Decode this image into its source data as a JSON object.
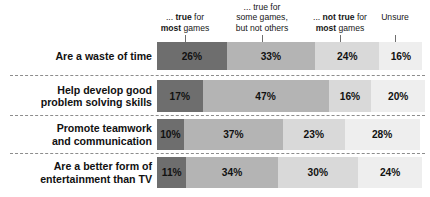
{
  "chart_data": {
    "type": "bar",
    "subtype": "stacked-horizontal-100",
    "title": "",
    "xlabel": "",
    "ylabel": "",
    "xlim": [
      0,
      100
    ],
    "grid": false,
    "legend_position": "top",
    "value_suffix": "%",
    "categories": [
      "Are a waste of time",
      "Help develop good problem solving skills",
      "Promote teamwork and communication",
      "Are a better form of entertainment than TV"
    ],
    "series": [
      {
        "name": "... true for most games",
        "values": [
          26,
          17,
          10,
          11
        ],
        "color": "#6e6e6e"
      },
      {
        "name": "... true for some games, but not others",
        "values": [
          33,
          47,
          37,
          34
        ],
        "color": "#b4b4b4"
      },
      {
        "name": "... not true for most games",
        "values": [
          24,
          16,
          23,
          30
        ],
        "color": "#d9d9d9"
      },
      {
        "name": "Unsure",
        "values": [
          16,
          20,
          28,
          24
        ],
        "color": "#eeeeee"
      }
    ]
  },
  "legend": {
    "columns": [
      {
        "id": "col-true-most",
        "line1_pre": "... ",
        "line1_bold": "true",
        "line1_post": " for",
        "line2_bold": "most",
        "line2_post": " games",
        "line0": ""
      },
      {
        "id": "col-some-games",
        "line0": "... true for",
        "line1_pre": "",
        "line1_bold": "",
        "line1_post": "some games,",
        "line2_bold": "",
        "line2_post": "but not others"
      },
      {
        "id": "col-not-true",
        "line0": "",
        "line1_pre": "... ",
        "line1_bold": "not true",
        "line1_post": " for",
        "line2_bold": "most",
        "line2_post": " games"
      },
      {
        "id": "col-unsure",
        "line0": "",
        "line1_pre": "",
        "line1_bold": "",
        "line1_post": "",
        "line2_bold": "",
        "line2_post": "Unsure"
      }
    ]
  },
  "rows": [
    {
      "label": "Are a waste of time",
      "label_lines": [
        "Are a waste of time"
      ],
      "cells": [
        {
          "value": 26,
          "text": "26%"
        },
        {
          "value": 33,
          "text": "33%"
        },
        {
          "value": 24,
          "text": "24%"
        },
        {
          "value": 16,
          "text": "16%"
        }
      ]
    },
    {
      "label": "Help develop good problem solving skills",
      "label_lines": [
        "Help develop good",
        "problem solving skills"
      ],
      "cells": [
        {
          "value": 17,
          "text": "17%"
        },
        {
          "value": 47,
          "text": "47%"
        },
        {
          "value": 16,
          "text": "16%"
        },
        {
          "value": 20,
          "text": "20%"
        }
      ]
    },
    {
      "label": "Promote teamwork and communication",
      "label_lines": [
        "Promote teamwork",
        "and communication"
      ],
      "cells": [
        {
          "value": 10,
          "text": "10%"
        },
        {
          "value": 37,
          "text": "37%"
        },
        {
          "value": 23,
          "text": "23%"
        },
        {
          "value": 28,
          "text": "28%"
        }
      ]
    },
    {
      "label": "Are a better form of entertainment than TV",
      "label_lines": [
        "Are a better form of",
        "entertainment than TV"
      ],
      "cells": [
        {
          "value": 11,
          "text": "11%"
        },
        {
          "value": 34,
          "text": "34%"
        },
        {
          "value": 30,
          "text": "30%"
        },
        {
          "value": 24,
          "text": "24%"
        }
      ]
    }
  ],
  "layout": {
    "bar_left": 157,
    "bar_width": 268,
    "row_tops": [
      42,
      80,
      119,
      157
    ],
    "row_heights": [
      28,
      32,
      31,
      31
    ],
    "separator_tops": [
      75,
      115,
      153
    ],
    "legend_tick_xs": [
      28,
      105,
      183,
      238
    ]
  },
  "colors": {
    "seg1": "#6e6e6e",
    "seg2": "#b4b4b4",
    "seg3": "#d9d9d9",
    "seg4": "#eeeeee",
    "text": "#111111",
    "separator": "#8d8d8d",
    "background": "#ffffff"
  }
}
